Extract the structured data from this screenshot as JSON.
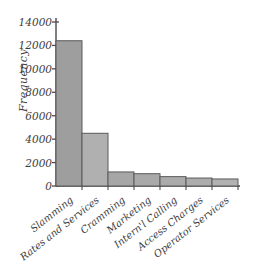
{
  "chart_data": {
    "type": "bar",
    "title": "",
    "subtitle": "",
    "xlabel": "",
    "ylabel": "Frequency",
    "categories": [
      "Slamming",
      "Rates and Services",
      "Cramming",
      "Marketing",
      "Intern'l Calling",
      "Access Charges",
      "Operator Services"
    ],
    "values": [
      12400,
      4500,
      1200,
      1050,
      800,
      680,
      600
    ],
    "ylim": [
      0,
      14000
    ],
    "yticks": [
      0,
      2000,
      4000,
      6000,
      8000,
      10000,
      12000,
      14000
    ],
    "ytick_labels": [
      "0",
      "2000",
      "4000",
      "6000",
      "8000",
      "10000",
      "12000",
      "14000"
    ],
    "grid": false,
    "legend": null,
    "bar_gap": 0,
    "colors": {
      "bar_fill_dark": "#9b9b9b",
      "bar_fill_light": "#b4b4b4",
      "bar_edge": "#5a5a5a",
      "axis": "#4a4a4a",
      "text": "#3d3d3d",
      "background": "#ffffff"
    },
    "bar_fills": [
      "#9e9e9e",
      "#b0b0b0",
      "#a6a6a6",
      "#a9a9a9",
      "#ababab",
      "#adadad",
      "#b2b2b2"
    ]
  },
  "axis": {
    "y_label_text": "Frequency"
  }
}
